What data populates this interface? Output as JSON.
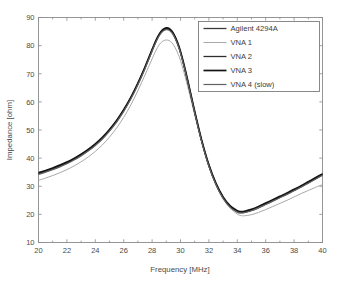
{
  "chart_data": {
    "type": "line",
    "title": "",
    "xlabel": "Frequency [MHz]",
    "ylabel": "Impedance [ohm]",
    "xlim": [
      20,
      40
    ],
    "ylim": [
      10,
      90
    ],
    "xticks": [
      20,
      22,
      24,
      26,
      28,
      30,
      32,
      34,
      36,
      38,
      40
    ],
    "yticks": [
      10,
      20,
      30,
      40,
      50,
      60,
      70,
      80,
      90
    ],
    "xtick_labels": [
      "20",
      "22",
      "24",
      "26",
      "28",
      "30",
      "32",
      "34",
      "36",
      "38",
      "40"
    ],
    "ytick_labels": [
      "10",
      "20",
      "30",
      "40",
      "50",
      "60",
      "70",
      "80",
      "90"
    ],
    "x_minor_tick_step": 1,
    "y_minor_tick_step": 10,
    "grid": false,
    "legend_position": "top-right",
    "legend_entries": [
      "Agilent 4294A",
      "VNA 1",
      "VNA 2",
      "VNA 3",
      "VNA 4 (slow)"
    ],
    "x": [
      20,
      20.5,
      21,
      21.5,
      22,
      22.5,
      23,
      23.5,
      24,
      24.5,
      25,
      25.5,
      26,
      26.5,
      27,
      27.5,
      28,
      28.25,
      28.5,
      28.75,
      29,
      29.2,
      29.4,
      29.6,
      29.8,
      30,
      30.25,
      30.5,
      30.75,
      31,
      31.5,
      32,
      32.5,
      33,
      33.5,
      34,
      34.25,
      34.5,
      35,
      35.5,
      36,
      36.5,
      37,
      37.5,
      38,
      38.5,
      39,
      39.5,
      40
    ],
    "series": [
      {
        "name": "Agilent 4294A",
        "color": "#3a3a3a",
        "width": 1.3,
        "values": [
          34.4,
          35.2,
          36.1,
          37.1,
          38.2,
          39.5,
          41.0,
          42.7,
          44.7,
          47.0,
          49.8,
          53.0,
          56.8,
          61.2,
          66.3,
          72.0,
          78.2,
          81.2,
          83.7,
          85.3,
          85.9,
          85.7,
          84.7,
          83.0,
          80.6,
          77.5,
          72.7,
          67.4,
          61.8,
          56.2,
          45.8,
          37.2,
          30.6,
          25.8,
          22.6,
          20.9,
          20.6,
          20.7,
          21.4,
          22.4,
          23.6,
          24.8,
          26.0,
          27.2,
          28.5,
          29.8,
          31.2,
          32.6,
          34.0
        ]
      },
      {
        "name": "VNA 1",
        "color": "#a8a8a8",
        "width": 1.0,
        "values": [
          32.1,
          32.9,
          33.8,
          34.8,
          35.9,
          37.2,
          38.7,
          40.4,
          42.4,
          44.7,
          47.5,
          50.7,
          54.5,
          58.9,
          64.0,
          69.6,
          75.3,
          78.1,
          80.3,
          81.6,
          82.0,
          81.8,
          81.0,
          79.5,
          77.4,
          74.7,
          70.4,
          65.6,
          60.5,
          55.4,
          45.6,
          37.3,
          30.8,
          25.9,
          22.3,
          20.1,
          19.6,
          19.5,
          19.9,
          20.7,
          21.7,
          22.8,
          23.9,
          25.0,
          26.2,
          27.4,
          28.5,
          29.6,
          30.6
        ]
      },
      {
        "name": "VNA 2",
        "color": "#2e2e2e",
        "width": 1.3,
        "values": [
          34.6,
          35.4,
          36.3,
          37.3,
          38.4,
          39.7,
          41.2,
          42.9,
          44.9,
          47.2,
          50.0,
          53.2,
          57.0,
          61.4,
          66.5,
          72.2,
          78.4,
          81.4,
          83.9,
          85.5,
          86.1,
          85.9,
          84.9,
          83.2,
          80.8,
          77.7,
          72.9,
          67.6,
          62.0,
          56.4,
          46.0,
          37.4,
          30.8,
          26.0,
          22.8,
          21.1,
          20.8,
          20.9,
          21.6,
          22.6,
          23.8,
          25.0,
          26.2,
          27.4,
          28.7,
          30.0,
          31.4,
          32.8,
          34.2
        ]
      },
      {
        "name": "VNA 3",
        "color": "#141414",
        "width": 1.7,
        "values": [
          34.8,
          35.6,
          36.5,
          37.5,
          38.6,
          39.9,
          41.4,
          43.1,
          45.1,
          47.4,
          50.2,
          53.4,
          57.2,
          61.6,
          66.7,
          72.4,
          78.6,
          81.6,
          84.1,
          85.7,
          86.3,
          86.1,
          85.1,
          83.4,
          81.0,
          77.9,
          73.1,
          67.8,
          62.2,
          56.6,
          46.2,
          37.6,
          31.0,
          26.2,
          23.0,
          21.3,
          21.0,
          21.1,
          21.8,
          22.8,
          24.0,
          25.2,
          26.4,
          27.6,
          28.9,
          30.2,
          31.6,
          33.0,
          34.4
        ]
      },
      {
        "name": "VNA 4 (slow)",
        "color": "#616161",
        "width": 1.2,
        "values": [
          34.2,
          35.0,
          35.9,
          36.9,
          38.0,
          39.3,
          40.8,
          42.5,
          44.5,
          46.8,
          49.6,
          52.8,
          56.6,
          61.0,
          66.1,
          71.8,
          78.0,
          81.0,
          83.5,
          85.1,
          85.7,
          85.5,
          84.5,
          82.8,
          80.4,
          77.3,
          72.5,
          67.2,
          61.6,
          56.0,
          45.7,
          37.1,
          30.5,
          25.7,
          22.5,
          20.8,
          20.5,
          20.6,
          21.3,
          22.3,
          23.5,
          24.7,
          25.9,
          27.1,
          28.4,
          29.7,
          31.1,
          32.5,
          33.9
        ]
      }
    ]
  },
  "colors": {
    "axis": "#8a8a8a",
    "text": "#4a4a4a",
    "legend_border": "#7d7d7d",
    "background": "#ffffff"
  }
}
